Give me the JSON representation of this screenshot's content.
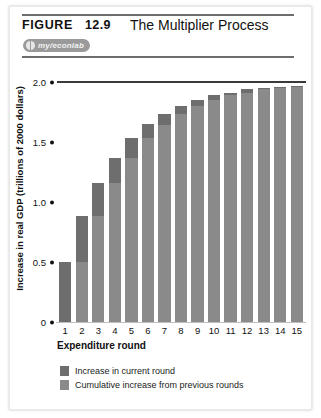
{
  "figure": {
    "label": "FIGURE",
    "number": "12.9",
    "title": "The Multiplier Process",
    "badge_text": "my/econlab",
    "badge_icon": "globe-icon"
  },
  "chart_data": {
    "type": "bar",
    "stacked": true,
    "title": "The Multiplier Process",
    "xlabel": "Expenditure round",
    "ylabel": "Increase in real GDP (trillions of 2000 dollars)",
    "categories": [
      "1",
      "2",
      "3",
      "4",
      "5",
      "6",
      "7",
      "8",
      "9",
      "10",
      "11",
      "12",
      "13",
      "14",
      "15"
    ],
    "ylim": [
      0,
      2.0
    ],
    "yticks": [
      "0",
      "0.5",
      "1.0",
      "1.5",
      "2.0"
    ],
    "ytick_values": [
      0,
      0.5,
      1.0,
      1.5,
      2.0
    ],
    "grid": false,
    "reference_line": 2.0,
    "legend_position": "below",
    "series": [
      {
        "name": "Cumulative increase from previous rounds",
        "color": "#8a8a8a",
        "values": [
          0,
          0.5,
          0.88,
          1.16,
          1.37,
          1.53,
          1.64,
          1.73,
          1.8,
          1.85,
          1.89,
          1.91,
          1.94,
          1.95,
          1.96
        ]
      },
      {
        "name": "Increase in current round",
        "color": "#6e6e6e",
        "values": [
          0.5,
          0.38,
          0.28,
          0.21,
          0.16,
          0.12,
          0.09,
          0.07,
          0.05,
          0.04,
          0.02,
          0.03,
          0.01,
          0.01,
          0.01
        ]
      }
    ],
    "totals": [
      0.5,
      0.88,
      1.16,
      1.37,
      1.53,
      1.64,
      1.73,
      1.8,
      1.85,
      1.89,
      1.91,
      1.94,
      1.95,
      1.96,
      1.97
    ]
  },
  "legend": {
    "items": [
      {
        "label": "Increase in current round",
        "swatch": "cur"
      },
      {
        "label": "Cumulative increase from previous rounds",
        "swatch": "prev"
      }
    ]
  }
}
